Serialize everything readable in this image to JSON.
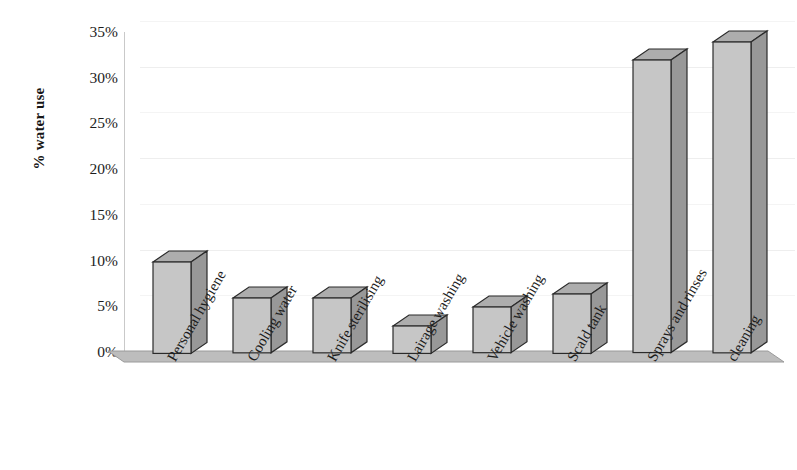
{
  "chart_data": {
    "type": "bar",
    "title": "",
    "xlabel": "",
    "ylabel": "% water use",
    "ylim": [
      0,
      35
    ],
    "ytick_step": 5,
    "grid": true,
    "legend": "none",
    "style": "3d-column",
    "categories": [
      "Personal hygiene",
      "Cooling water",
      "Knife sterilising",
      "Lairage washing",
      "Vehicle washing",
      "Scald tank",
      "Sprays and rinses",
      "cleaning"
    ],
    "category_lines": [
      [
        "Personal",
        "hygiene"
      ],
      [
        "Cooling",
        "water"
      ],
      [
        "Knife",
        "sterilising"
      ],
      [
        "Lairage",
        "washing"
      ],
      [
        "Vehicle",
        "washing"
      ],
      [
        "Scald tank"
      ],
      [
        "Sprays and",
        "rinses"
      ],
      [
        "cleaning"
      ]
    ],
    "values": [
      10,
      6,
      6,
      3,
      5,
      6.5,
      32,
      34
    ],
    "value_labels": [
      "10%",
      "6%",
      "6%",
      "3%",
      "5%",
      "6.5%",
      "32%",
      "34%"
    ],
    "ytick_labels": [
      "0%",
      "5%",
      "10%",
      "15%",
      "20%",
      "25%",
      "30%",
      "35%"
    ],
    "ytick_values": [
      0,
      5,
      10,
      15,
      20,
      25,
      30,
      35
    ]
  },
  "colors": {
    "bar_front": "#c6c6c6",
    "bar_side": "#989898",
    "bar_top": "#adadad",
    "bar_outline": "#2b2b2b",
    "floor": "#bdbdbd",
    "floor_edge": "#8f8f8f",
    "gridline": "#eeeeee",
    "axis": "#c9c9c9",
    "text": "#1d1d1d",
    "background": "#ffffff"
  }
}
